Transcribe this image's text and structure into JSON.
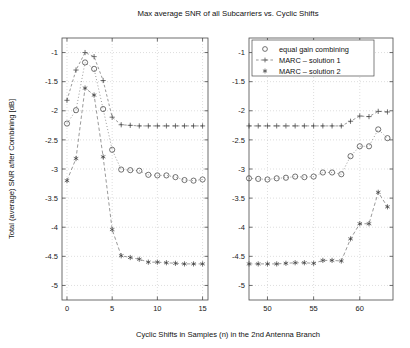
{
  "chart_data": {
    "type": "line",
    "title": "Max average SNR of all Subcarriers vs. Cyclic Shifts",
    "xlabel": "Cyclic Shifts in Samples (n) in the 2nd Antenna Branch",
    "ylabel": "Total (average) SNR after Combining [dB]",
    "grid": true,
    "legend_position": "top-right",
    "ylim": [
      -5.25,
      -0.75
    ],
    "yticks": [
      -1,
      -1.5,
      -2,
      -2.5,
      -3,
      -3.5,
      -4,
      -4.5,
      -5
    ],
    "ytick_labels": [
      "-1",
      "-1.5",
      "-2",
      "-2.5",
      "-3",
      "-3.5",
      "-4",
      "-4.5",
      "-5"
    ],
    "panels": [
      {
        "name": "left-panel",
        "xlim": [
          -0.55,
          15.6
        ],
        "xticks": [
          0,
          5,
          10,
          15
        ],
        "xtick_labels": [
          "0",
          "5",
          "10",
          "15"
        ],
        "x": [
          0,
          1,
          2,
          3,
          4,
          5,
          6,
          7,
          8,
          9,
          10,
          11,
          12,
          13,
          14,
          15
        ],
        "series": [
          {
            "name": "equal gain combining",
            "marker": "circle",
            "values": [
              -2.22,
              -1.99,
              -1.17,
              -1.28,
              -1.97,
              -2.67,
              -3.01,
              -3.02,
              -3.03,
              -3.1,
              -3.11,
              -3.11,
              -3.14,
              -3.19,
              -3.2,
              -3.18
            ]
          },
          {
            "name": "MARC - solution 1",
            "marker": "plus",
            "values": [
              -1.82,
              -1.3,
              -1.0,
              -1.07,
              -1.48,
              -2.11,
              -2.24,
              -2.25,
              -2.26,
              -2.26,
              -2.26,
              -2.26,
              -2.26,
              -2.26,
              -2.26,
              -2.26
            ]
          },
          {
            "name": "MARC - solution 2",
            "marker": "asterisk",
            "values": [
              -3.2,
              -2.82,
              -1.61,
              -1.73,
              -2.79,
              -4.04,
              -4.49,
              -4.52,
              -4.55,
              -4.6,
              -4.6,
              -4.61,
              -4.62,
              -4.63,
              -4.63,
              -4.63
            ]
          }
        ]
      },
      {
        "name": "right-panel",
        "xlim": [
          48.0,
          63.6
        ],
        "xticks": [
          50,
          55,
          60
        ],
        "xtick_labels": [
          "50",
          "55",
          "60"
        ],
        "x": [
          48,
          49,
          50,
          51,
          52,
          53,
          54,
          55,
          56,
          57,
          58,
          59,
          60,
          61,
          62,
          63
        ],
        "series": [
          {
            "name": "equal gain combining",
            "marker": "circle",
            "values": [
              -3.16,
              -3.17,
              -3.18,
              -3.16,
              -3.15,
              -3.13,
              -3.14,
              -3.13,
              -3.06,
              -3.06,
              -3.09,
              -2.78,
              -2.61,
              -2.61,
              -2.32,
              -2.47
            ]
          },
          {
            "name": "MARC - solution 1",
            "marker": "plus",
            "values": [
              -2.26,
              -2.26,
              -2.26,
              -2.26,
              -2.26,
              -2.26,
              -2.26,
              -2.26,
              -2.26,
              -2.26,
              -2.26,
              -2.18,
              -2.09,
              -2.1,
              -2.01,
              -2.02
            ]
          },
          {
            "name": "MARC - solution 2",
            "marker": "asterisk",
            "values": [
              -4.63,
              -4.63,
              -4.63,
              -4.63,
              -4.62,
              -4.61,
              -4.61,
              -4.62,
              -4.57,
              -4.57,
              -4.58,
              -4.2,
              -3.94,
              -3.94,
              -3.4,
              -3.65
            ]
          }
        ]
      }
    ],
    "legend": [
      {
        "label": "equal gain combining",
        "marker": "circle"
      },
      {
        "label": "MARC – solution 1",
        "marker": "plus-line"
      },
      {
        "label": "MARC – solution 2",
        "marker": "asterisk"
      }
    ],
    "colors": {
      "axis": "#4a4a4a",
      "grid": "#bdbdbd",
      "marker": "#3a3a3a",
      "background": "#ffffff",
      "text": "#111111"
    }
  }
}
